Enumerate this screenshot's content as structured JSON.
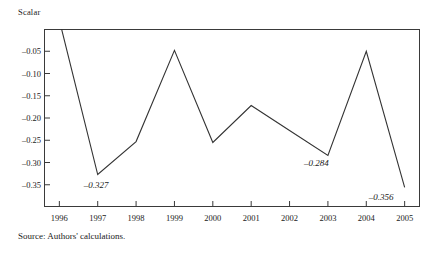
{
  "figure": {
    "axis_unit_label": "Scalar",
    "source_note": "Source: Authors' calculations.",
    "top_clipped_text": "",
    "line_color": "#333333",
    "frame_color": "#3a3a3a"
  },
  "chart_data": {
    "type": "line",
    "title": "",
    "subtitle": "",
    "xlabel": "",
    "ylabel": "Scalar",
    "x": [
      1996,
      1997,
      1998,
      1999,
      2000,
      2001,
      2002,
      2003,
      2004,
      2005
    ],
    "categories": [
      "1996",
      "1997",
      "1998",
      "1999",
      "2000",
      "2001",
      "2002",
      "2003",
      "2004",
      "2005"
    ],
    "values": [
      0.02,
      -0.327,
      -0.253,
      -0.048,
      -0.255,
      -0.172,
      -0.228,
      -0.284,
      -0.05,
      -0.356
    ],
    "series": [
      {
        "name": "Scalar",
        "values": [
          0.02,
          -0.327,
          -0.253,
          -0.048,
          -0.255,
          -0.172,
          -0.228,
          -0.284,
          -0.05,
          -0.356
        ]
      }
    ],
    "ylim": [
      -0.4,
      0.0
    ],
    "xlim": [
      1995.6,
      2005.4
    ],
    "yticks": [
      -0.05,
      -0.1,
      -0.15,
      -0.2,
      -0.25,
      -0.3,
      -0.35
    ],
    "ytick_labels": [
      "–0.05",
      "–0.10",
      "–0.15",
      "–0.20",
      "–0.25",
      "–0.30",
      "–0.35"
    ],
    "xtick_labels": [
      "1996",
      "1997",
      "1998",
      "1999",
      "2000",
      "2001",
      "2002",
      "2003",
      "2004",
      "2005"
    ],
    "grid": false,
    "legend": false,
    "legend_position": "none",
    "annotations": [
      {
        "text": "–0.327",
        "x": 1997,
        "y": -0.327
      },
      {
        "text": "–0.284",
        "x": 2003,
        "y": -0.284
      },
      {
        "text": "–0.356",
        "x": 2005,
        "y": -0.356
      }
    ]
  }
}
